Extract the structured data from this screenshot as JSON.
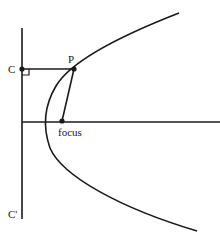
{
  "diagram": {
    "labels": {
      "C": "C",
      "C_prime": "C'",
      "P": "P",
      "focus": "focus"
    },
    "elements": [
      "directrix line CC'",
      "axis of symmetry",
      "parabola curve",
      "segment CP perpendicular to directrix",
      "segment P to focus",
      "right-angle marker at C"
    ],
    "colors": {
      "stroke": "#1a1a1a",
      "background": "#ffffff"
    }
  }
}
